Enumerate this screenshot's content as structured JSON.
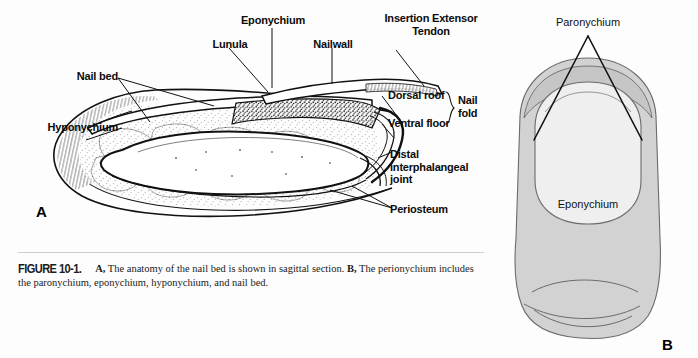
{
  "figure": {
    "number": "FIGURE 10-1.",
    "panel_a_marker": "A",
    "panel_b_marker": "B",
    "caption_a_bold": "A,",
    "caption_a_text": " The anatomy of the nail bed is shown in sagittal section. ",
    "caption_b_bold": "B,",
    "caption_b_text": " The perionychium includes the paronychium, eponychium, hyponychium, and nail bed."
  },
  "panel_a": {
    "title": "Sagittal section of the nail bed",
    "labels": {
      "lunula": "Lunula",
      "eponychium": "Eponychium",
      "nailwall": "Nailwall",
      "insertion_extensor_tendon": "Insertion Extensor\nTendon",
      "nail_bed": "Nail bed",
      "hyponychium": "Hyponychium",
      "dorsal_roof": "Dorsal roof",
      "ventral_floor": "Ventral floor",
      "nail_fold": "Nail\nfold",
      "distal_interphalangeal_joint": "Distal\ninterphalangeal\njoint",
      "periosteum": "Periosteum"
    }
  },
  "panel_b": {
    "title": "Perionychium, dorsal view",
    "labels": {
      "paronychium": "Paronychium",
      "eponychium": "Eponychium"
    }
  },
  "colors": {
    "page_background": "#fdfdfd",
    "ink": "#0b0b0b",
    "finger_fill": "#d2d2d2",
    "nail_plate_fill": "#f0f0f0",
    "outline": "#3d3d3d",
    "rule": "#cfcfcf"
  }
}
